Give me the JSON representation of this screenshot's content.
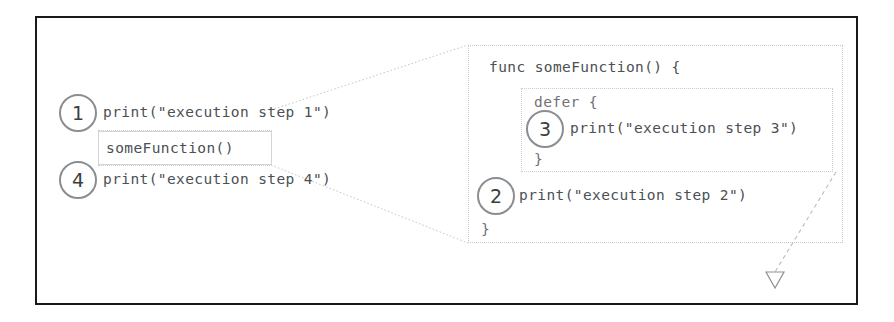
{
  "diagram": {
    "frame": {
      "border_color": "#18191b"
    },
    "left_code": {
      "lines": [
        {
          "id": "line-step1",
          "text": "print(\"execution step 1\")",
          "step": "1"
        },
        {
          "id": "line-call",
          "text": "someFunction()",
          "step": ""
        },
        {
          "id": "line-step4",
          "text": "print(\"execution step 4\")",
          "step": "4"
        }
      ]
    },
    "right_code": {
      "header": "func someFunction() {",
      "defer_open": "defer {",
      "defer_body": "print(\"execution step 3\")",
      "defer_close": "}",
      "body_line": "print(\"execution step 2\")",
      "func_close": "}"
    },
    "steps": {
      "one": "1",
      "two": "2",
      "three": "3",
      "four": "4"
    },
    "colors": {
      "frame": "#18191b",
      "code_text": "#4c4f54",
      "circle_stroke": "#8b8d90",
      "dotted_line": "#c2c4c7"
    },
    "arrow": {
      "name": "defer-return-arrow",
      "head": "hollow-triangle-down"
    }
  }
}
